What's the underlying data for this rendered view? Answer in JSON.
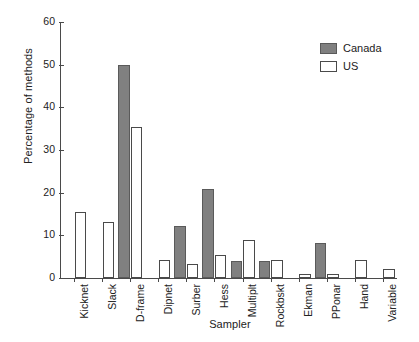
{
  "chart_data": {
    "type": "bar",
    "title": "",
    "xlabel": "Sampler",
    "ylabel": "Percentage of methods",
    "ylim": [
      0,
      60
    ],
    "yticks": [
      0,
      10,
      20,
      30,
      40,
      50,
      60
    ],
    "grid": false,
    "legend_position": "top-right",
    "categories": [
      "Kicknet",
      "Slack",
      "D-frame",
      "Dipnet",
      "Surber",
      "Hess",
      "Multiplt",
      "Rockbskt",
      "Ekman",
      "PPonar",
      "Hand",
      "Variable"
    ],
    "series": [
      {
        "name": "Canada",
        "color": "#808080",
        "values": [
          0,
          0,
          50.0,
          0,
          12.3,
          20.9,
          4.0,
          4.1,
          0,
          8.2,
          0,
          0
        ]
      },
      {
        "name": "US",
        "color": "#ffffff",
        "values": [
          15.4,
          13.2,
          35.4,
          4.3,
          3.2,
          5.5,
          8.8,
          4.3,
          1.0,
          1.0,
          4.3,
          2.0
        ]
      }
    ]
  },
  "legend": {
    "items": [
      {
        "label": "Canada",
        "swatch": "filled-gray"
      },
      {
        "label": "US",
        "swatch": "outline-white"
      }
    ]
  },
  "axis": {
    "y_title": "Percentage of methods",
    "x_title": "Sampler",
    "y_tick_labels": [
      "0",
      "10",
      "20",
      "30",
      "40",
      "50",
      "60"
    ]
  }
}
